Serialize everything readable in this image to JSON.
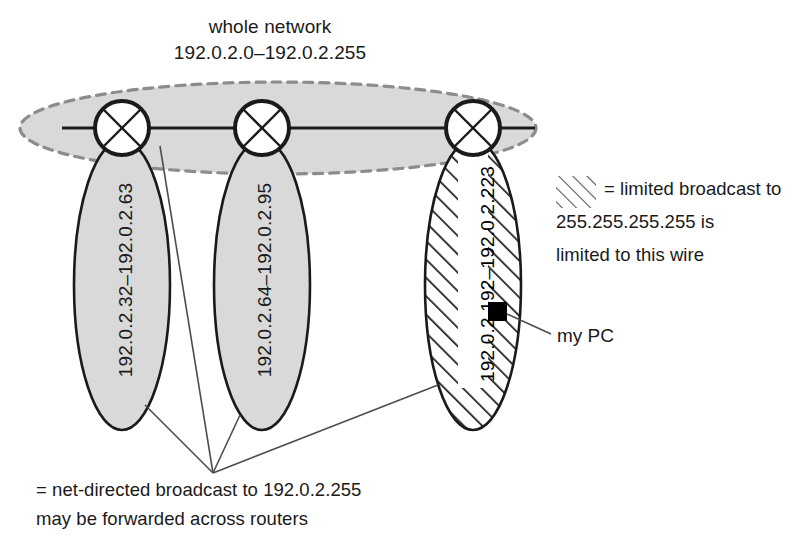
{
  "diagram": {
    "title": {
      "line1": "whole network",
      "line2": "192.0.2.0–192.0.2.255"
    },
    "subnets": [
      {
        "id": "subnet-a",
        "label": "192.0.2.32–192.0.2.63",
        "fill": "#d9d9d9",
        "hatched": false
      },
      {
        "id": "subnet-b",
        "label": "192.0.2.64–192.0.2.95",
        "fill": "#d9d9d9",
        "hatched": false
      },
      {
        "id": "subnet-c",
        "label": "192.0.2.192–192.0.2.223",
        "fill": "#ffffff",
        "hatched": true
      }
    ],
    "routers": [
      {
        "id": "router-1",
        "icon": "router-circle-x-icon"
      },
      {
        "id": "router-2",
        "icon": "router-circle-x-icon"
      },
      {
        "id": "router-3",
        "icon": "router-circle-x-icon"
      }
    ],
    "host": {
      "icon": "pc-square-icon",
      "label": "my PC",
      "color": "#000000"
    },
    "legend": {
      "limited_broadcast": {
        "swatch": "diagonal-hatch-swatch",
        "line1": "= limited broadcast to",
        "line2": "255.255.255.255 is",
        "line3": "limited to this wire"
      },
      "net_directed_broadcast": {
        "line1": "= net-directed broadcast to 192.0.2.255",
        "line2": "may be forwarded across routers"
      }
    },
    "colors": {
      "subnet_fill": "#d9d9d9",
      "network_fill": "#d9d9d9",
      "network_dash_stroke": "#8c8c8c",
      "outline": "#1a1a1a",
      "leader_line": "#4d4d4d",
      "hatch": "#1a1a1a",
      "text": "#1a1a1a"
    }
  }
}
